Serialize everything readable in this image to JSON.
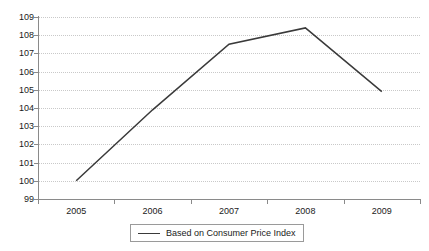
{
  "chart_data": {
    "type": "line",
    "title": "",
    "subtitle": "",
    "xlabel": "",
    "ylabel": "",
    "categories": [
      "2005",
      "2006",
      "2007",
      "2008",
      "2009"
    ],
    "series": [
      {
        "name": "Based on Consumer Price Index",
        "color": "#3a3a3a",
        "values": [
          100.0,
          103.9,
          107.5,
          108.4,
          104.9
        ]
      }
    ],
    "ylim": [
      99,
      109
    ],
    "ytick_step": 1,
    "yticks": [
      99,
      100,
      101,
      102,
      103,
      104,
      105,
      106,
      107,
      108,
      109
    ],
    "ytick_labels": [
      "99",
      "100",
      "101",
      "102",
      "103",
      "104",
      "105",
      "106",
      "107",
      "108",
      "109"
    ],
    "xtick_labels": [
      "2005",
      "2006",
      "2007",
      "2008",
      "2009"
    ],
    "grid": {
      "horizontal": true,
      "vertical": false,
      "style": "dotted",
      "color": "#c9c9c9"
    },
    "legend": {
      "position": "bottom-center",
      "bordered": true,
      "entries": [
        {
          "label": "Based on Consumer Price Index",
          "marker": "line",
          "color": "#3a3a3a"
        }
      ]
    },
    "axis_color": "#8a8a8a",
    "background": "#ffffff"
  },
  "legend": {
    "entry_label": "Based on Consumer Price Index"
  }
}
